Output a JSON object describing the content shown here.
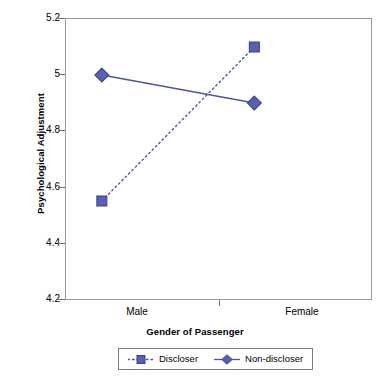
{
  "chart_data": {
    "type": "line",
    "title": "",
    "xlabel": "Gender of Passenger",
    "ylabel": "Psychological Adjustment",
    "categories": [
      "Male",
      "Female"
    ],
    "ylim": [
      4.2,
      5.2
    ],
    "yticks": [
      "5.2",
      "5",
      "4.8",
      "4.6",
      "4.4",
      "4.2"
    ],
    "ytick_values": [
      5.2,
      5.0,
      4.8,
      4.6,
      4.4,
      4.2
    ],
    "grid": false,
    "legend_position": "bottom",
    "series": [
      {
        "name": "Discloser",
        "values": [
          4.55,
          5.1
        ],
        "marker": "square",
        "linestyle": "dotted",
        "color": "#4b53a8"
      },
      {
        "name": "Non-discloser",
        "values": [
          5.0,
          4.9
        ],
        "marker": "diamond",
        "linestyle": "solid",
        "color": "#4b53a8"
      }
    ]
  },
  "axes": {
    "y_title": "Psychological Adjustment",
    "x_title": "Gender of Passenger",
    "y_tick_labels": [
      "5.2",
      "5",
      "4.8",
      "4.6",
      "4.4",
      "4.2"
    ],
    "x_tick_labels": [
      "Male",
      "Female"
    ]
  },
  "legend": {
    "items": [
      {
        "label": "Discloser",
        "marker": "square",
        "style": "dotted"
      },
      {
        "label": "Non-discloser",
        "marker": "diamond",
        "style": "solid"
      }
    ]
  },
  "colors": {
    "series": "#4b53a8",
    "marker_fill": "#5a61b3",
    "marker_stroke": "#3d4491",
    "axis": "#9a9a9a",
    "text": "#000000",
    "background": "#ffffff"
  }
}
